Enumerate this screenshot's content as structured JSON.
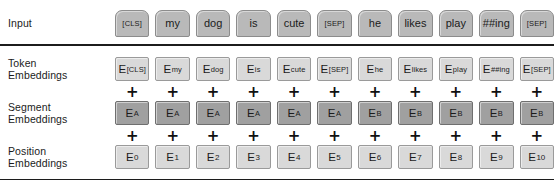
{
  "diagram": {
    "colors": {
      "token_box_fill": "#d9d9d9",
      "token_box_border": "#9a9a9a",
      "segment_box_fill": "#a0a0a0",
      "segment_box_border": "#6f6f6f",
      "input_token_fill": "#b9b9b9",
      "input_token_border": "#8c8c8c",
      "rule": "#1c1c1c",
      "text": "#1b1b1b",
      "background": "#ffffff"
    },
    "operator": "+"
  },
  "rows": {
    "input": {
      "label": "Input",
      "tokens": [
        "[CLS]",
        "my",
        "dog",
        "is",
        "cute",
        "[SEP]",
        "he",
        "likes",
        "play",
        "##ing",
        "[SEP]"
      ]
    },
    "token_embeddings": {
      "label": "Token\nEmbeddings",
      "base": "E",
      "subscripts": [
        "[CLS]",
        "my",
        "dog",
        "is",
        "cute",
        "[SEP]",
        "he",
        "likes",
        "play",
        "##ing",
        "[SEP]"
      ],
      "cells": [
        "E[CLS]",
        "Emy",
        "Edog",
        "Eis",
        "Ecute",
        "E[SEP]",
        "Ehe",
        "Elikes",
        "Eplay",
        "E##ing",
        "E[SEP]"
      ]
    },
    "segment_embeddings": {
      "label": "Segment\nEmbeddings",
      "base": "E",
      "subscripts": [
        "A",
        "A",
        "A",
        "A",
        "A",
        "A",
        "B",
        "B",
        "B",
        "B",
        "B"
      ],
      "cells": [
        "EA",
        "EA",
        "EA",
        "EA",
        "EA",
        "EA",
        "EB",
        "EB",
        "EB",
        "EB",
        "EB"
      ]
    },
    "position_embeddings": {
      "label": "Position\nEmbeddings",
      "base": "E",
      "subscripts": [
        "0",
        "1",
        "2",
        "3",
        "4",
        "5",
        "6",
        "7",
        "8",
        "9",
        "10"
      ],
      "cells": [
        "E0",
        "E1",
        "E2",
        "E3",
        "E4",
        "E5",
        "E6",
        "E7",
        "E8",
        "E9",
        "E10"
      ]
    }
  },
  "operators": {
    "plus_row_1": [
      "+",
      "+",
      "+",
      "+",
      "+",
      "+",
      "+",
      "+",
      "+",
      "+",
      "+"
    ],
    "plus_row_2": [
      "+",
      "+",
      "+",
      "+",
      "+",
      "+",
      "+",
      "+",
      "+",
      "+",
      "+"
    ]
  }
}
